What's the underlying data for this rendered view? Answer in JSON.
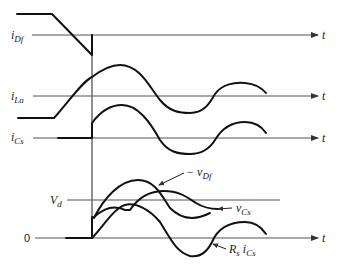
{
  "diagram": {
    "type": "waveform-timing-diagram",
    "time_axis_label": "t",
    "traces": [
      {
        "id": "iDf",
        "label_main": "i",
        "label_sub": "Df"
      },
      {
        "id": "iLa",
        "label_main": "i",
        "label_sub": "La"
      },
      {
        "id": "iCs",
        "label_main": "i",
        "label_sub": "Cs"
      }
    ],
    "voltage_panel": {
      "level_label_main": "V",
      "level_label_sub": "d",
      "zero_label": "0",
      "annotations": [
        {
          "id": "vDf",
          "prefix": "− ",
          "main": "v",
          "sub": "Df"
        },
        {
          "id": "vCs",
          "prefix": "",
          "main": "v",
          "sub": "Cs"
        },
        {
          "id": "RsiCs",
          "prefix": "",
          "main": "R",
          "sub": "s",
          "main2": "i",
          "sub2": "Cs"
        }
      ]
    }
  }
}
